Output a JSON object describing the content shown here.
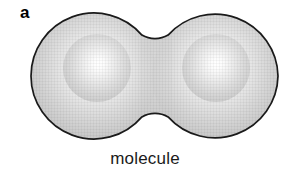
{
  "figure": {
    "panel_label": "a",
    "caption": "molecule",
    "background_color": "#ffffff",
    "outline_color": "#1a1a1a",
    "label_color": "#000000",
    "caption_color": "#1a1a1a"
  },
  "diagram": {
    "type": "schematic",
    "shape_name": "dumbbell-two-lobes",
    "outline_width_px": 1.6,
    "fill_highlight_color": "#ffffff",
    "fill_mid_color": "#d8d8d8",
    "fill_edge_color": "#b3b3b3",
    "lobes": [
      {
        "name": "left-atom",
        "center_x": 94,
        "center_y": 76,
        "radius": 63,
        "highlight_x": 97,
        "highlight_y": 68
      },
      {
        "name": "right-atom",
        "center_x": 215,
        "center_y": 76,
        "radius": 63,
        "highlight_x": 216,
        "highlight_y": 68
      }
    ],
    "neck": {
      "center_x": 155,
      "top_y": 32,
      "bottom_y": 120,
      "fillet_radius": 26
    },
    "bounds": {
      "left": 31,
      "right": 278,
      "top": 13,
      "bottom": 139
    }
  }
}
